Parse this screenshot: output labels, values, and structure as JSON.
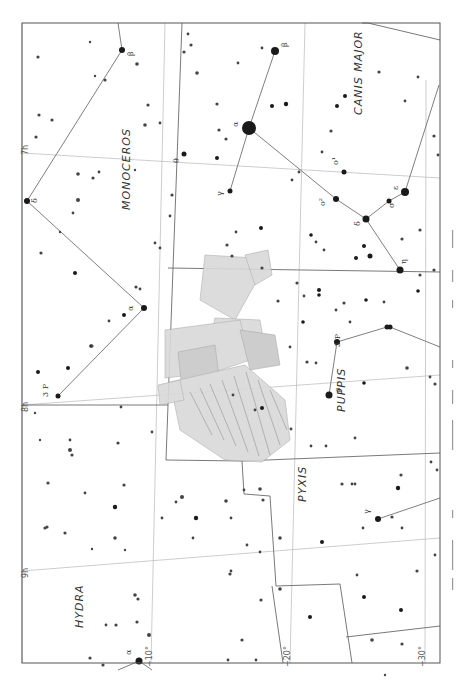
{
  "chart": {
    "frame": {
      "x": 22,
      "y": 23,
      "w": 418,
      "h": 640
    },
    "constellations": [
      {
        "name": "MONOCEROS",
        "x": 130,
        "y": 210,
        "rot": -90,
        "size": 11
      },
      {
        "name": "CANIS MAJOR",
        "x": 362,
        "y": 115,
        "rot": -90,
        "size": 11
      },
      {
        "name": "PUPPIS",
        "x": 345,
        "y": 412,
        "rot": -90,
        "size": 11
      },
      {
        "name": "PYXIS",
        "x": 306,
        "y": 502,
        "rot": -90,
        "size": 11
      },
      {
        "name": "HYDRA",
        "x": 83,
        "y": 628,
        "rot": -90,
        "size": 11
      }
    ],
    "coordinate_labels": [
      {
        "text": "7h",
        "x": 28,
        "y": 155,
        "rot": -90
      },
      {
        "text": "8h",
        "x": 28,
        "y": 412,
        "rot": -90
      },
      {
        "text": "9h",
        "x": 28,
        "y": 578,
        "rot": -90
      },
      {
        "text": "−10°",
        "x": 152,
        "y": 667,
        "rot": -90
      },
      {
        "text": "−20°",
        "x": 290,
        "y": 667,
        "rot": -90
      },
      {
        "text": "−30°",
        "x": 425,
        "y": 667,
        "rot": -90
      }
    ],
    "greek_labels": [
      {
        "text": "β",
        "x": 133,
        "y": 56
      },
      {
        "text": "δ",
        "x": 37,
        "y": 203
      },
      {
        "text": "θ",
        "x": 179,
        "y": 163
      },
      {
        "text": "α",
        "x": 238,
        "y": 127
      },
      {
        "text": "γ",
        "x": 222,
        "y": 196
      },
      {
        "text": "β",
        "x": 287,
        "y": 47
      },
      {
        "text": "o¹",
        "x": 338,
        "y": 165
      },
      {
        "text": "o²",
        "x": 325,
        "y": 206
      },
      {
        "text": "δ",
        "x": 360,
        "y": 226
      },
      {
        "text": "ε",
        "x": 398,
        "y": 190
      },
      {
        "text": "σ",
        "x": 394,
        "y": 208
      },
      {
        "text": "η",
        "x": 406,
        "y": 264
      },
      {
        "text": "α",
        "x": 133,
        "y": 311
      },
      {
        "text": "3 P",
        "x": 48,
        "y": 397
      },
      {
        "text": "3 P",
        "x": 340,
        "y": 347
      },
      {
        "text": "ρ",
        "x": 340,
        "y": 392
      },
      {
        "text": "γ",
        "x": 369,
        "y": 514
      },
      {
        "text": "α",
        "x": 131,
        "y": 655
      }
    ],
    "ship_figure": "Argo Navis (stern section) illustration"
  }
}
